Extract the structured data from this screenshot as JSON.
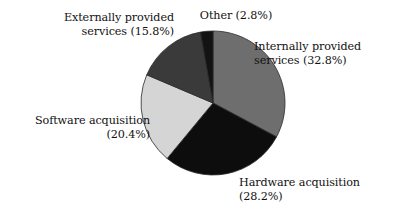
{
  "chart_data": {
    "type": "pie",
    "title": "",
    "subtitle": "",
    "xlabel": "",
    "ylabel": "",
    "legend_position": "none",
    "grid": false,
    "start_angle_deg": 0,
    "direction": "clockwise",
    "center": {
      "x": 213,
      "y": 103
    },
    "radius": 72,
    "categories": [
      "Internally provided services",
      "Hardware acquisition",
      "Software acquisition",
      "Externally provided services",
      "Other"
    ],
    "values": [
      32.8,
      28.2,
      20.4,
      15.8,
      2.8
    ],
    "unit": "%",
    "slices": [
      {
        "name": "internally-provided-services",
        "label": "Internally provided services",
        "value": 32.8,
        "value_text": "(32.8%)",
        "color": "#6e6e6e"
      },
      {
        "name": "hardware-acquisition",
        "label": "Hardware acquisition",
        "value": 28.2,
        "value_text": "(28.2%)",
        "color": "#0d0d0d"
      },
      {
        "name": "software-acquisition",
        "label": "Software acquisition",
        "value": 20.4,
        "value_text": "(20.4%)",
        "color": "#d5d5d5"
      },
      {
        "name": "externally-provided-services",
        "label": "Externally provided services",
        "value": 15.8,
        "value_text": "(15.8%)",
        "color": "#3a3a3a"
      },
      {
        "name": "other",
        "label": "Other",
        "value": 2.8,
        "value_text": "(2.8%)",
        "color": "#131313"
      }
    ]
  },
  "labels": {
    "external": "Externally provided\nservices (15.8%)",
    "other": "Other (2.8%)",
    "internal": "Internally provided\nservices (32.8%)",
    "software": "Software acquisition\n(20.4%)",
    "hardware": "Hardware acquisition\n(28.2%)"
  },
  "colors": {
    "background": "#ffffff",
    "text": "#111111",
    "slice_outline": "#2b2b2b"
  }
}
